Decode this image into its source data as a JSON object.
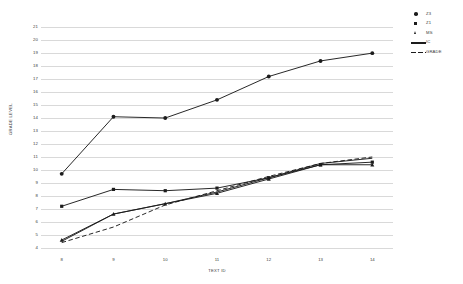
{
  "chart_data": {
    "type": "line",
    "title": "",
    "xlabel": "TEXT ID",
    "ylabel": "GRADE LEVEL",
    "x": [
      8,
      9,
      10,
      11,
      12,
      13,
      14
    ],
    "categories": [
      "8",
      "9",
      "10",
      "11",
      "12",
      "13",
      "14"
    ],
    "xlim": [
      7.6,
      14.4
    ],
    "ylim": [
      3.6,
      21.4
    ],
    "yticks": [
      4,
      5,
      6,
      7,
      8,
      9,
      10,
      11,
      12,
      13,
      14,
      15,
      16,
      17,
      18,
      19,
      20,
      21
    ],
    "ytick_labels": [
      "4",
      "5",
      "6",
      "7",
      "8",
      "9",
      "10",
      "11",
      "12",
      "13",
      "14",
      "15",
      "16",
      "17",
      "18",
      "19",
      "20",
      "21"
    ],
    "grid": "horizontal",
    "legend_position": "top-right",
    "series": [
      {
        "name": "Z3",
        "marker": "circle",
        "linestyle": "solid",
        "color": "#1c1c1c",
        "values": [
          9.7,
          14.1,
          14.0,
          15.4,
          17.2,
          18.4,
          19.0
        ]
      },
      {
        "name": "Z1",
        "marker": "square",
        "linestyle": "solid",
        "color": "#1c1c1c",
        "values": [
          7.2,
          8.5,
          8.4,
          8.6,
          9.4,
          10.4,
          10.6
        ]
      },
      {
        "name": "MS",
        "marker": "triangle",
        "linestyle": "solid",
        "color": "#1c1c1c",
        "values": [
          4.6,
          6.6,
          7.4,
          8.2,
          9.3,
          10.4,
          10.4
        ]
      },
      {
        "name": "IC",
        "marker": "none",
        "linestyle": "solid",
        "color": "#1c1c1c",
        "values": [
          4.5,
          6.6,
          7.4,
          8.3,
          9.4,
          10.5,
          10.9
        ]
      },
      {
        "name": "GRADE",
        "marker": "none",
        "linestyle": "dashed",
        "color": "#1c1c1c",
        "values": [
          4.4,
          5.6,
          7.3,
          8.4,
          9.5,
          10.5,
          11.0
        ]
      }
    ]
  },
  "axes": {
    "y_title": "GRADE LEVEL",
    "x_title": "TEXT ID"
  },
  "legend": {
    "items": [
      {
        "label": "Z3"
      },
      {
        "label": "Z1"
      },
      {
        "label": "MS"
      },
      {
        "label": "IC"
      },
      {
        "label": "GRADE"
      }
    ]
  },
  "style": {
    "background": "#ffffff",
    "grid_color": "#d9d9d9",
    "ink": "#1c1c1c",
    "tick_text": "#3a3a3a"
  }
}
